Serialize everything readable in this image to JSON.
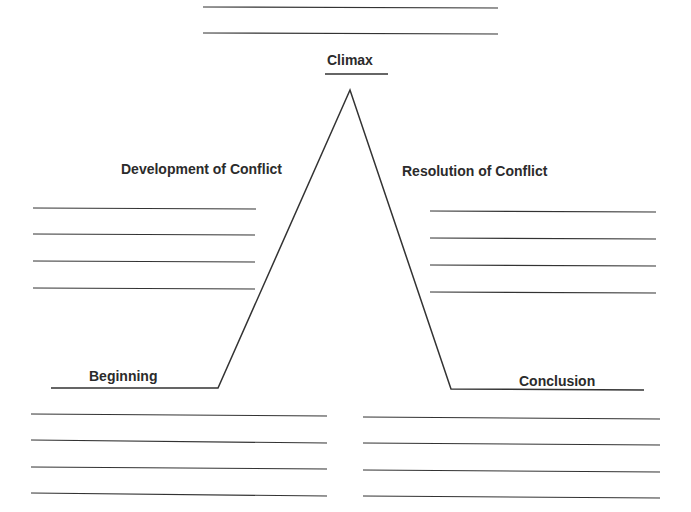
{
  "diagram": {
    "type": "plot-diagram",
    "labels": {
      "climax": "Climax",
      "development": "Development of Conflict",
      "resolution": "Resolution of Conflict",
      "beginning": "Beginning",
      "conclusion": "Conclusion"
    },
    "line_color": "#333333",
    "writing_lines": {
      "climax_top": 2,
      "development": 4,
      "resolution": 4,
      "beginning": 4,
      "conclusion": 4
    }
  }
}
